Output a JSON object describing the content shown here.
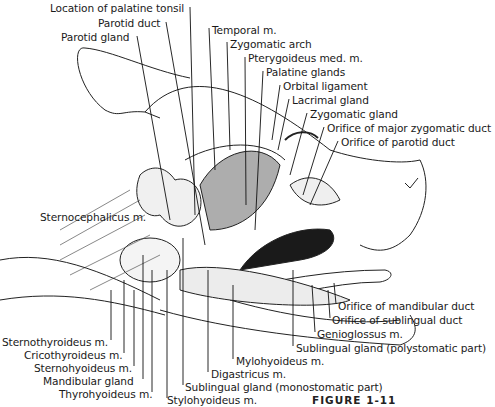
{
  "figure": {
    "caption": "FIGURE 1-11",
    "labels_top": [
      {
        "id": "palatine-tonsil",
        "text": "Location of palatine tonsil",
        "x": 50,
        "y": 2
      },
      {
        "id": "parotid-duct",
        "text": "Parotid duct",
        "x": 98,
        "y": 17
      },
      {
        "id": "parotid-gland",
        "text": "Parotid gland",
        "x": 61,
        "y": 31
      },
      {
        "id": "temporal",
        "text": "Temporal m.",
        "x": 212,
        "y": 24
      },
      {
        "id": "zygomatic-arch",
        "text": "Zygomatic arch",
        "x": 230,
        "y": 38
      },
      {
        "id": "pterygoideus",
        "text": "Pterygoideus med. m.",
        "x": 248,
        "y": 52
      },
      {
        "id": "palatine-glands",
        "text": "Palatine glands",
        "x": 266,
        "y": 66
      },
      {
        "id": "orbital-ligament",
        "text": "Orbital ligament",
        "x": 283,
        "y": 80
      },
      {
        "id": "lacrimal-gland",
        "text": "Lacrimal gland",
        "x": 292,
        "y": 94
      },
      {
        "id": "zygomatic-gland",
        "text": "Zygomatic gland",
        "x": 310,
        "y": 108
      },
      {
        "id": "orifice-major-zygomatic",
        "text": "Orifice of major zygomatic duct",
        "x": 327,
        "y": 122
      },
      {
        "id": "orifice-parotid",
        "text": "Orifice of parotid duct",
        "x": 341,
        "y": 136
      }
    ],
    "labels_mid": [
      {
        "id": "sternocephalicus",
        "text": "Sternocephalicus m.",
        "x": 40,
        "y": 211
      }
    ],
    "labels_bottom_right": [
      {
        "id": "orifice-mandibular",
        "text": "Orifice of mandibular duct",
        "x": 338,
        "y": 300
      },
      {
        "id": "orifice-sublingual",
        "text": "Orifice of sublingual duct",
        "x": 332,
        "y": 314
      },
      {
        "id": "genioglossus",
        "text": "Genioglossus m.",
        "x": 317,
        "y": 328
      },
      {
        "id": "sublingual-poly",
        "text": "Sublingual gland (polystomatic part)",
        "x": 296,
        "y": 342
      }
    ],
    "labels_bottom": [
      {
        "id": "sternothyroideus",
        "text": "Sternothyroideus m.",
        "x": 2,
        "y": 336
      },
      {
        "id": "cricothyroideus",
        "text": "Cricothyroideus m.",
        "x": 24,
        "y": 349
      },
      {
        "id": "sternohyoideus",
        "text": "Sternohyoideus m.",
        "x": 34,
        "y": 362
      },
      {
        "id": "mandibular-gland",
        "text": "Mandibular gland",
        "x": 43,
        "y": 375
      },
      {
        "id": "thyrohyoideus",
        "text": "Thyrohyoideus m.",
        "x": 59,
        "y": 388
      },
      {
        "id": "mylohyoideus",
        "text": "Mylohyoideus m.",
        "x": 236,
        "y": 355
      },
      {
        "id": "digastricus",
        "text": "Digastricus m.",
        "x": 211,
        "y": 368
      },
      {
        "id": "sublingual-mono",
        "text": "Sublingual gland (monostomatic part)",
        "x": 185,
        "y": 381
      },
      {
        "id": "stylohyoideus",
        "text": "Stylohyoideus m.",
        "x": 167,
        "y": 394
      }
    ]
  }
}
